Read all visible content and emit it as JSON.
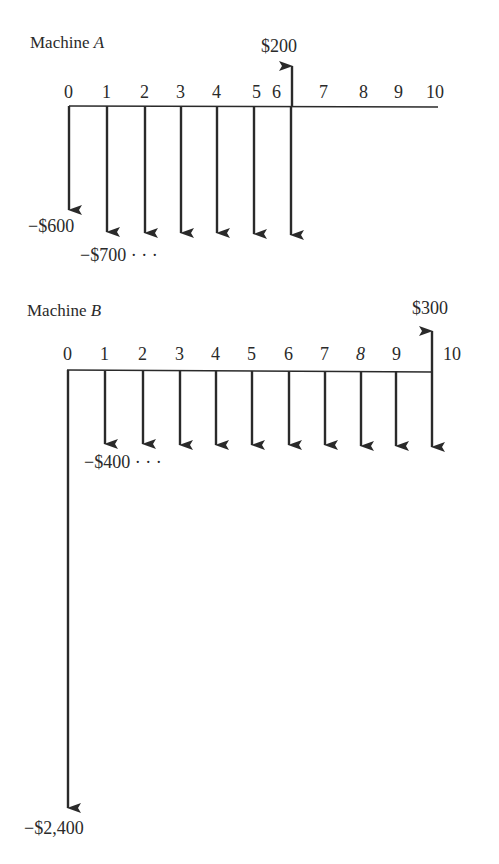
{
  "diagrams": [
    {
      "title": "Machine",
      "title_letter": "A",
      "periods": [
        "0",
        "1",
        "2",
        "3",
        "4",
        "5",
        "6",
        "7",
        "8",
        "9",
        "10"
      ],
      "cash_flows": [
        {
          "period": 0,
          "amount": -600,
          "label": "−$600"
        },
        {
          "period": 1,
          "amount": -700,
          "label": "−$700 · · ·"
        },
        {
          "period": 2,
          "amount": -700
        },
        {
          "period": 3,
          "amount": -700
        },
        {
          "period": 4,
          "amount": -700
        },
        {
          "period": 5,
          "amount": -700
        },
        {
          "period": 6,
          "amount": -700
        },
        {
          "period": 6,
          "amount": 200,
          "label": "$200"
        }
      ]
    },
    {
      "title": "Machine",
      "title_letter": "B",
      "periods": [
        "0",
        "1",
        "2",
        "3",
        "4",
        "5",
        "6",
        "7",
        "8",
        "9",
        "10"
      ],
      "cash_flows": [
        {
          "period": 0,
          "amount": -2400,
          "label": "−$2,400"
        },
        {
          "period": 1,
          "amount": -400,
          "label": "−$400 · · ·"
        },
        {
          "period": 2,
          "amount": -400
        },
        {
          "period": 3,
          "amount": -400
        },
        {
          "period": 4,
          "amount": -400
        },
        {
          "period": 5,
          "amount": -400
        },
        {
          "period": 6,
          "amount": -400
        },
        {
          "period": 7,
          "amount": -400
        },
        {
          "period": 8,
          "amount": -400
        },
        {
          "period": 9,
          "amount": -400
        },
        {
          "period": 10,
          "amount": -400
        },
        {
          "period": 10,
          "amount": 300,
          "label": "$300"
        }
      ]
    }
  ],
  "colors": {
    "ink": "#2a2a2a",
    "background": "#ffffff"
  }
}
